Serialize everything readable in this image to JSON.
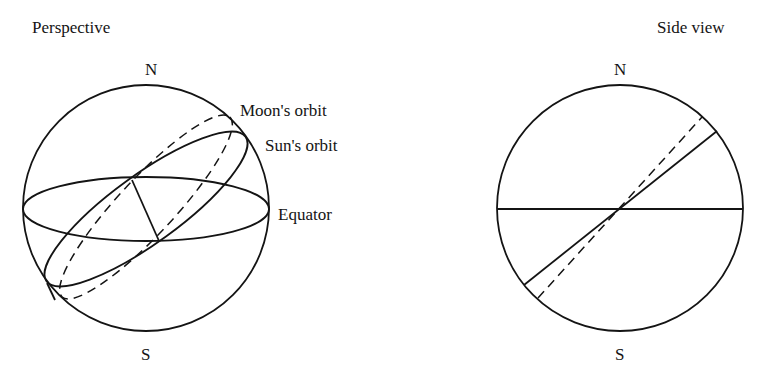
{
  "perspective": {
    "title": "Perspective",
    "north": "N",
    "south": "S",
    "labels": {
      "moon_orbit": "Moon's orbit",
      "sun_orbit": "Sun's orbit",
      "equator": "Equator"
    }
  },
  "side_view": {
    "title": "Side view",
    "north": "N",
    "south": "S"
  },
  "colors": {
    "ink": "#141414",
    "background": "#ffffff"
  }
}
